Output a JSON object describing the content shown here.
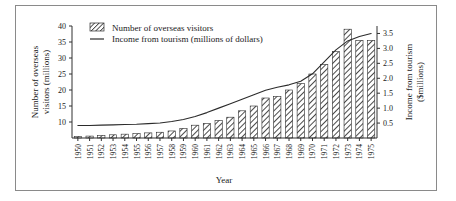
{
  "figure": {
    "xlabel": "Year",
    "ylabel_left": "Number of overseas visitors (millions)",
    "ylabel_left_line1": "Number of overseas",
    "ylabel_left_line2": "visitors (millions)",
    "ylabel_right_line1": "Income from tourism",
    "ylabel_right_line2": "($millions)",
    "ylabel_right": "Income from tourism ($millions)",
    "border_color": "#8a8a8a",
    "ink_color": "#2b2b2b"
  },
  "legend": {
    "position": "top-left-inside",
    "entries": [
      {
        "label": "Number of overseas visitors",
        "marker": "hatched-swatch"
      },
      {
        "label": "Income from tourism (millions of dollars)",
        "marker": "line"
      }
    ]
  },
  "chart_data": {
    "type": "bar",
    "title": "",
    "subtitle": "",
    "xlabel": "Year",
    "ylabel": "Number of overseas visitors (millions)",
    "ylabel_secondary": "Income from tourism ($millions)",
    "grid": false,
    "legend_position": "top-left",
    "categories": [
      "1950",
      "1951",
      "1952",
      "1953",
      "1954",
      "1955",
      "1956",
      "1957",
      "1958",
      "1959",
      "1960",
      "1961",
      "1962",
      "1963",
      "1964",
      "1965",
      "1966",
      "1967",
      "1968",
      "1969",
      "1970",
      "1971",
      "1972",
      "1973",
      "1974",
      "1975"
    ],
    "ylim": [
      5,
      40
    ],
    "yticks": [
      10,
      15,
      20,
      25,
      30,
      35,
      40
    ],
    "ylim_secondary": [
      0,
      3.75
    ],
    "yticks_secondary": [
      0.5,
      1.0,
      1.5,
      2.0,
      2.5,
      3.0,
      3.5
    ],
    "series": [
      {
        "name": "Number of overseas visitors",
        "unit": "millions",
        "axis": "left",
        "kind": "bar",
        "values": [
          5.5,
          5.6,
          5.8,
          6.0,
          6.2,
          6.4,
          6.6,
          6.8,
          7.2,
          8.0,
          9.0,
          9.5,
          10.5,
          11.5,
          13.5,
          15.0,
          17.5,
          18.0,
          20.0,
          22.0,
          25.0,
          28.0,
          32.0,
          39.0,
          35.5,
          35.5
        ]
      },
      {
        "name": "Income from tourism",
        "unit": "$millions",
        "axis": "right",
        "kind": "line",
        "values": [
          0.42,
          0.42,
          0.43,
          0.44,
          0.45,
          0.46,
          0.48,
          0.5,
          0.55,
          0.62,
          0.72,
          0.85,
          1.0,
          1.15,
          1.3,
          1.45,
          1.6,
          1.7,
          1.78,
          1.9,
          2.15,
          2.55,
          2.95,
          3.25,
          3.4,
          3.5
        ]
      }
    ]
  }
}
